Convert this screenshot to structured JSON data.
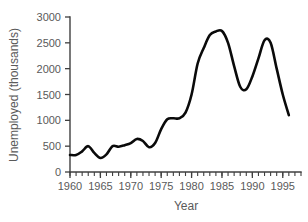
{
  "chart_data": {
    "type": "line",
    "title": "",
    "xlabel": "Year",
    "ylabel": "Unemployed (thousands)",
    "xlim": [
      1960,
      1998
    ],
    "ylim": [
      0,
      3000
    ],
    "grid": false,
    "legend": "none",
    "line_color": "#0a0a0a",
    "axis_color": "#3f3f3f",
    "text_color": "#5a5a5a",
    "x_ticks_major": [
      1960,
      1965,
      1970,
      1975,
      1980,
      1985,
      1990,
      1995
    ],
    "x_tick_labels": [
      "1960",
      "1965",
      "1970",
      "1975",
      "1980",
      "1985",
      "1990",
      "1995"
    ],
    "x_minor_tick_step": 1,
    "y_ticks": [
      0,
      500,
      1000,
      1500,
      2000,
      2500,
      3000
    ],
    "y_tick_labels": [
      "0",
      "500",
      "1000",
      "1500",
      "2000",
      "2500",
      "3000"
    ],
    "series": [
      {
        "name": "Unemployed",
        "x": [
          1960,
          1961,
          1962,
          1963,
          1964,
          1965,
          1966,
          1967,
          1968,
          1969,
          1970,
          1971,
          1972,
          1973,
          1974,
          1975,
          1976,
          1977,
          1978,
          1979,
          1980,
          1981,
          1982,
          1983,
          1984,
          1985,
          1986,
          1987,
          1988,
          1989,
          1990,
          1991,
          1992,
          1993,
          1994,
          1995,
          1996
        ],
        "values": [
          330,
          330,
          400,
          500,
          370,
          270,
          340,
          500,
          490,
          520,
          560,
          640,
          600,
          480,
          560,
          830,
          1020,
          1040,
          1040,
          1150,
          1500,
          2100,
          2400,
          2650,
          2720,
          2730,
          2500,
          2050,
          1650,
          1600,
          1850,
          2200,
          2550,
          2500,
          2000,
          1500,
          1100
        ]
      }
    ]
  }
}
